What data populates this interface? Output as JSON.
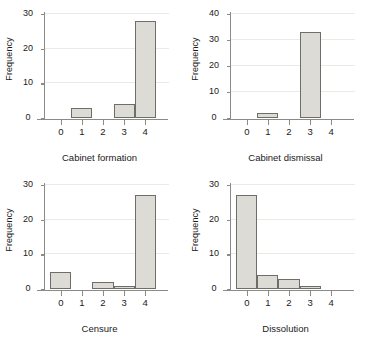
{
  "figure": {
    "background": "#ffffff",
    "bar_fill": "#dddbd5",
    "bar_edge": "#6e6e68",
    "axis_color": "#8a8a86",
    "grid_color": "#eceae6"
  },
  "chart_data": [
    {
      "type": "bar",
      "title": "",
      "xlabel": "Cabinet formation",
      "ylabel": "Frequency",
      "categories": [
        "0",
        "1",
        "2",
        "3",
        "4"
      ],
      "x": [
        0,
        1,
        2,
        3,
        4
      ],
      "values": [
        0,
        3,
        0,
        4,
        28
      ],
      "xlim": [
        -0.75,
        4.75
      ],
      "ylim": [
        0,
        30
      ],
      "yticks": [
        0,
        10,
        20,
        30
      ],
      "xticks": [
        0,
        1,
        2,
        3,
        4
      ],
      "grid": "horizontal",
      "legend": "none"
    },
    {
      "type": "bar",
      "title": "",
      "xlabel": "Cabinet dismissal",
      "ylabel": "Frequency",
      "categories": [
        "0",
        "1",
        "2",
        "3",
        "4"
      ],
      "x": [
        0,
        1,
        2,
        3,
        4
      ],
      "values": [
        0,
        2,
        0,
        33,
        0
      ],
      "xlim": [
        -0.75,
        4.75
      ],
      "ylim": [
        0,
        40
      ],
      "yticks": [
        0,
        10,
        20,
        30,
        40
      ],
      "xticks": [
        0,
        1,
        2,
        3,
        4
      ],
      "grid": "horizontal",
      "legend": "none"
    },
    {
      "type": "bar",
      "title": "",
      "xlabel": "Censure",
      "ylabel": "Frequency",
      "categories": [
        "0",
        "1",
        "2",
        "3",
        "4"
      ],
      "x": [
        0,
        1,
        2,
        3,
        4
      ],
      "values": [
        5,
        0,
        2,
        1,
        27
      ],
      "xlim": [
        -0.75,
        4.75
      ],
      "ylim": [
        0,
        30
      ],
      "yticks": [
        0,
        10,
        20,
        30
      ],
      "xticks": [
        0,
        1,
        2,
        3,
        4
      ],
      "grid": "horizontal",
      "legend": "none"
    },
    {
      "type": "bar",
      "title": "",
      "xlabel": "Dissolution",
      "ylabel": "Frequency",
      "categories": [
        "0",
        "1",
        "2",
        "3",
        "4"
      ],
      "x": [
        0,
        1,
        2,
        3,
        4
      ],
      "values": [
        27,
        4,
        3,
        1,
        0
      ],
      "xlim": [
        -0.75,
        4.75
      ],
      "ylim": [
        0,
        30
      ],
      "yticks": [
        0,
        10,
        20,
        30
      ],
      "xticks": [
        0,
        1,
        2,
        3,
        4
      ],
      "grid": "horizontal",
      "legend": "none"
    }
  ]
}
